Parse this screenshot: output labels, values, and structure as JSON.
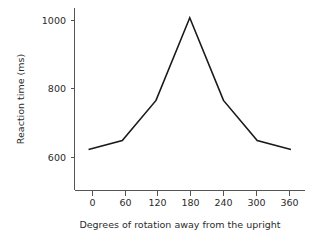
{
  "chart_data": {
    "type": "line",
    "title": "",
    "xlabel": "Degrees of rotation away from the upright",
    "ylabel": "Reaction time (ms)",
    "x": [
      0,
      60,
      120,
      180,
      240,
      300,
      360
    ],
    "values": [
      600,
      632,
      775,
      1070,
      775,
      632,
      600
    ],
    "series": [
      {
        "name": "Reaction time",
        "values": [
          600,
          632,
          775,
          1070,
          775,
          632,
          600
        ]
      }
    ],
    "xticks": [
      "0",
      "60",
      "120",
      "180",
      "240",
      "300",
      "360"
    ],
    "yticks": [
      "600",
      "800",
      "1000"
    ],
    "xtick_values": [
      0,
      60,
      120,
      180,
      240,
      300,
      360
    ],
    "ytick_values": [
      600,
      800,
      1000
    ],
    "xlim": [
      -25,
      385
    ],
    "ylim": [
      455,
      1105
    ],
    "grid": false,
    "legend": false,
    "line_color": "#1a1a1a",
    "axis_color": "#555555",
    "background": "#ffffff"
  }
}
